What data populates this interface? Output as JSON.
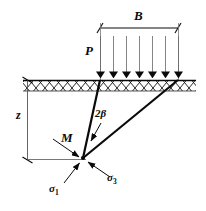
{
  "figure": {
    "type": "geotechnical-stress-diagram",
    "background_color": "#ffffff",
    "line_color": "#0a0a0a"
  },
  "labels": {
    "width_dimension": "B",
    "load": "P",
    "depth_dimension": "z",
    "apex_angle": "2β",
    "point": "M",
    "minor_stress_base": "σ",
    "minor_stress_sub": "1",
    "major_stress_base": "σ",
    "major_stress_sub": "3"
  },
  "geometry": {
    "ground_line": {
      "x1": 23,
      "y1": 80,
      "x2": 196,
      "y2": 80
    },
    "hatch_band": {
      "x": 23,
      "y": 80,
      "width": 173,
      "height": 11
    },
    "load_strip": {
      "x_left": 100,
      "x_right": 178,
      "y": 80
    },
    "load_arrow_count": 7,
    "load_arrow_top_y": 36,
    "dimension_line_B": {
      "x1": 100,
      "y1": 28,
      "x2": 178,
      "y2": 28
    },
    "depth_dimension_line": {
      "x": 27,
      "y_top": 80,
      "y_bottom": 160
    },
    "point_M": {
      "x": 83,
      "y": 158
    },
    "wedge_left_line": {
      "x1": 100,
      "y1": 80,
      "x2": 83,
      "y2": 158
    },
    "wedge_right_line": {
      "x1": 178,
      "y1": 80,
      "x2": 83,
      "y2": 158
    },
    "sigma1_arrow": {
      "from_x": 64,
      "from_y": 182,
      "to_x": 79,
      "to_y": 163
    },
    "sigma3_arrow": {
      "from_x": 108,
      "from_y": 176,
      "to_x": 88,
      "to_y": 162
    },
    "M_leader_arrow": {
      "from_x": 55,
      "from_y": 141,
      "to_x": 79,
      "to_y": 157
    },
    "beta_leader_arrow": {
      "from_x": 101,
      "from_y": 123,
      "to_x": 91,
      "to_y": 141
    }
  }
}
